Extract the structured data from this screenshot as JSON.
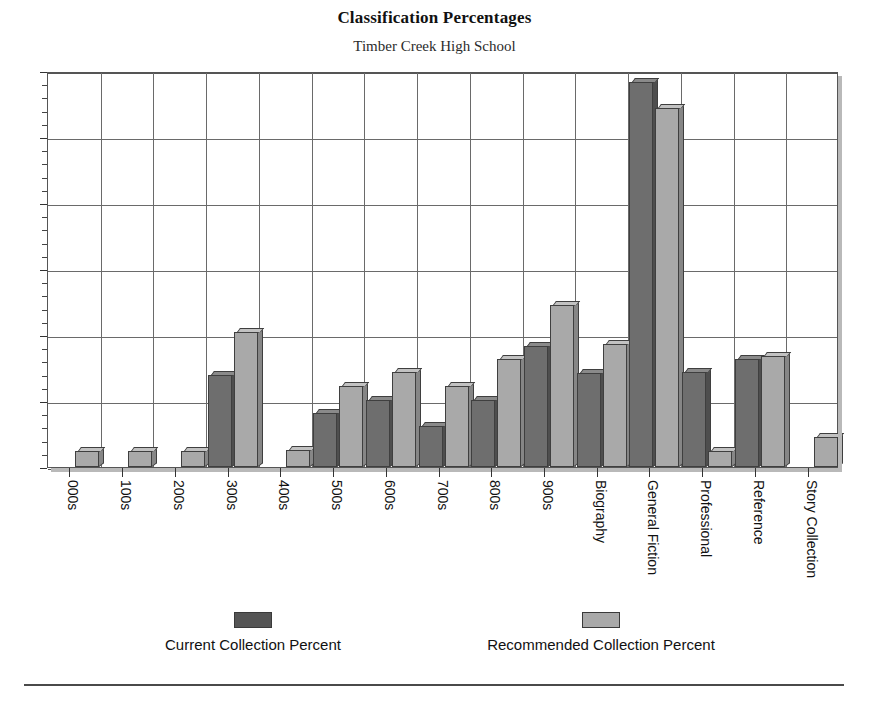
{
  "chart_data": {
    "type": "bar",
    "title": "Classification Percentages",
    "subtitle": "Timber Creek High School",
    "xlabel": "",
    "ylabel": "",
    "ylim": [
      0,
      30
    ],
    "ytick_step": 5,
    "yminor_step": 1,
    "grid": true,
    "legend_position": "bottom",
    "categories": [
      "000s",
      "100s",
      "200s",
      "300s",
      "400s",
      "500s",
      "600s",
      "700s",
      "800s",
      "900s",
      "Biography",
      "General Fiction",
      "Professional",
      "Reference",
      "Story Collection"
    ],
    "ytick_labels": [
      "0",
      "5",
      "10",
      "15",
      "20",
      "25",
      "30"
    ],
    "series": [
      {
        "name": "Current Collection Percent",
        "color": "#6e6e6e",
        "values": [
          0,
          0,
          0,
          7.0,
          0,
          4.1,
          5.1,
          3.1,
          5.1,
          9.2,
          7.1,
          29.2,
          7.2,
          8.2,
          0
        ]
      },
      {
        "name": "Recommended Collection Percent",
        "color": "#a9a9a9",
        "values": [
          1.2,
          1.2,
          1.2,
          10.2,
          1.3,
          6.1,
          7.2,
          6.1,
          8.2,
          12.3,
          9.3,
          27.2,
          1.2,
          8.4,
          2.3
        ]
      }
    ]
  },
  "legend": {
    "entries": [
      {
        "label": "Current Collection Percent",
        "swatch": "current"
      },
      {
        "label": "Recommended Collection Percent",
        "swatch": "recommended"
      }
    ]
  }
}
